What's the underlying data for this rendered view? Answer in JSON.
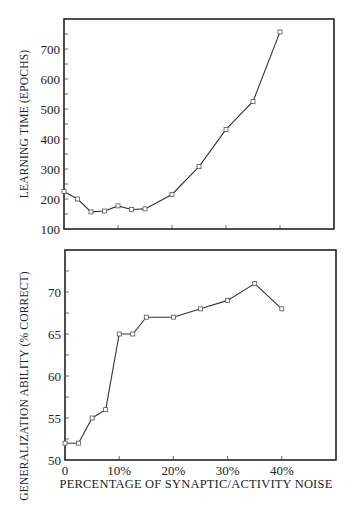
{
  "chart_data": [
    {
      "type": "line",
      "title": "",
      "xlabel": "",
      "ylabel": "LEARNING TIME (EPOCHS)",
      "x": [
        0,
        2.5,
        5,
        7.5,
        10,
        12.5,
        15,
        20,
        25,
        30,
        35,
        40
      ],
      "series": [
        {
          "name": "Learning time",
          "values": [
            225,
            200,
            157,
            160,
            177,
            165,
            167,
            215,
            308,
            432,
            525,
            757
          ]
        }
      ],
      "xlim": [
        0,
        50
      ],
      "ylim": [
        100,
        800
      ],
      "yticks": [
        100,
        200,
        300,
        400,
        500,
        600,
        700
      ],
      "ytick_labels": [
        "100",
        "200",
        "300",
        "400",
        "500",
        "600",
        "700"
      ],
      "xticks": [
        0,
        10,
        20,
        30,
        40
      ],
      "xtick_labels": [],
      "marker": "square",
      "grid": false,
      "legend": null
    },
    {
      "type": "line",
      "title": "",
      "xlabel": "PERCENTAGE OF SYNAPTIC/ACTIVITY NOISE",
      "ylabel": "GENERALIZATION ABILITY (% CORRECT)",
      "x": [
        0,
        2.5,
        5,
        7.5,
        10,
        12.5,
        15,
        20,
        25,
        30,
        35,
        40
      ],
      "series": [
        {
          "name": "Generalization ability",
          "values": [
            52,
            52,
            55,
            56,
            65,
            65,
            67,
            67,
            68,
            69,
            71,
            68
          ]
        }
      ],
      "xlim": [
        0,
        50
      ],
      "ylim": [
        50,
        75
      ],
      "yticks": [
        50,
        55,
        60,
        65,
        70
      ],
      "ytick_labels": [
        "50",
        "55",
        "60",
        "65",
        "70"
      ],
      "xticks": [
        0,
        10,
        20,
        30,
        40
      ],
      "xtick_labels": [
        "0",
        "10%",
        "20%",
        "30%",
        "40%"
      ],
      "marker": "square",
      "grid": false,
      "legend": null
    }
  ],
  "top": {
    "ylabel": "LEARNING TIME (EPOCHS)",
    "yticks": [
      "100",
      "200",
      "300",
      "400",
      "500",
      "600",
      "700"
    ]
  },
  "bottom": {
    "ylabel": "GENERALIZATION ABILITY (% CORRECT)",
    "xlabel": "PERCENTAGE OF SYNAPTIC/ACTIVITY NOISE",
    "yticks": [
      "50",
      "55",
      "60",
      "65",
      "70"
    ],
    "xticks": [
      "0",
      "10%",
      "20%",
      "30%",
      "40%"
    ]
  }
}
